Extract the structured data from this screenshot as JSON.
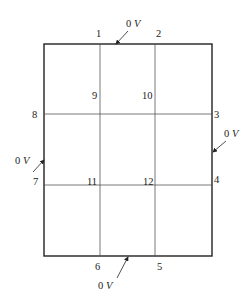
{
  "diagram": {
    "type": "finite-difference grid with boundary potentials",
    "outer_rect": {
      "x1": 44,
      "y1": 44,
      "x2": 212,
      "y2": 256
    },
    "inner_vertical_lines_x": [
      100,
      155
    ],
    "inner_horizontal_lines_y": [
      114,
      185
    ],
    "node_labels": [
      {
        "id": "1",
        "text": "1",
        "x": 96,
        "y": 37
      },
      {
        "id": "2",
        "text": "2",
        "x": 156,
        "y": 37
      },
      {
        "id": "3",
        "text": "3",
        "x": 214,
        "y": 118
      },
      {
        "id": "4",
        "text": "4",
        "x": 214,
        "y": 183
      },
      {
        "id": "5",
        "text": "5",
        "x": 157,
        "y": 270
      },
      {
        "id": "6",
        "text": "6",
        "x": 95,
        "y": 270
      },
      {
        "id": "7",
        "text": "7",
        "x": 33,
        "y": 185
      },
      {
        "id": "8",
        "text": "8",
        "x": 32,
        "y": 118
      },
      {
        "id": "9",
        "text": "9",
        "x": 92,
        "y": 99
      },
      {
        "id": "10",
        "text": "10",
        "x": 142,
        "y": 99
      },
      {
        "id": "11",
        "text": "11",
        "x": 87,
        "y": 185
      },
      {
        "id": "12",
        "text": "12",
        "x": 143,
        "y": 185
      }
    ],
    "boundary_voltages": [
      {
        "side": "top",
        "num": "0",
        "unit": "V",
        "label_x": 126,
        "label_y": 27,
        "arrow": {
          "x1": 128,
          "y1": 31,
          "x2": 116,
          "y2": 44
        }
      },
      {
        "side": "right",
        "num": "0",
        "unit": "V",
        "label_x": 224,
        "label_y": 137,
        "arrow": {
          "x1": 226,
          "y1": 141,
          "x2": 213,
          "y2": 152
        }
      },
      {
        "side": "left",
        "num": "0",
        "unit": "V",
        "label_x": 15,
        "label_y": 164,
        "arrow": {
          "x1": 33,
          "y1": 172,
          "x2": 44,
          "y2": 160
        }
      },
      {
        "side": "bottom",
        "num": "0",
        "unit": "V",
        "label_x": 98,
        "label_y": 289,
        "arrow": {
          "x1": 117,
          "y1": 278,
          "x2": 128,
          "y2": 257
        }
      }
    ]
  }
}
